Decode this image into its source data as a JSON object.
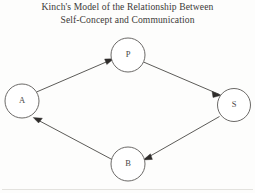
{
  "title": {
    "line1": "Kinch's Model of the Relationship Between",
    "line2": "Self-Concept and Communication"
  },
  "colors": {
    "background": "#fdfdfc",
    "title_text": "#3b3a38",
    "node_stroke": "#5a5856",
    "node_fill": "#ffffff",
    "node_label": "#4a4846",
    "edge_stroke": "#4a4845",
    "arrow_fill": "#2e2c2a"
  },
  "diagram": {
    "type": "cycle-diagram",
    "nodes": [
      {
        "id": "A",
        "label": "A",
        "cx": 22,
        "cy": 101,
        "r": 17
      },
      {
        "id": "P",
        "label": "P",
        "cx": 128,
        "cy": 55,
        "r": 17
      },
      {
        "id": "S",
        "label": "S",
        "cx": 234,
        "cy": 105,
        "r": 16.5
      },
      {
        "id": "B",
        "label": "B",
        "cx": 128,
        "cy": 164,
        "r": 17
      }
    ],
    "edges": [
      {
        "from": "A",
        "to": "P",
        "arrow_at": "P"
      },
      {
        "from": "P",
        "to": "S",
        "arrow_at": "S"
      },
      {
        "from": "S",
        "to": "B",
        "arrow_at": "B"
      },
      {
        "from": "B",
        "to": "A",
        "arrow_at": "A"
      }
    ]
  }
}
